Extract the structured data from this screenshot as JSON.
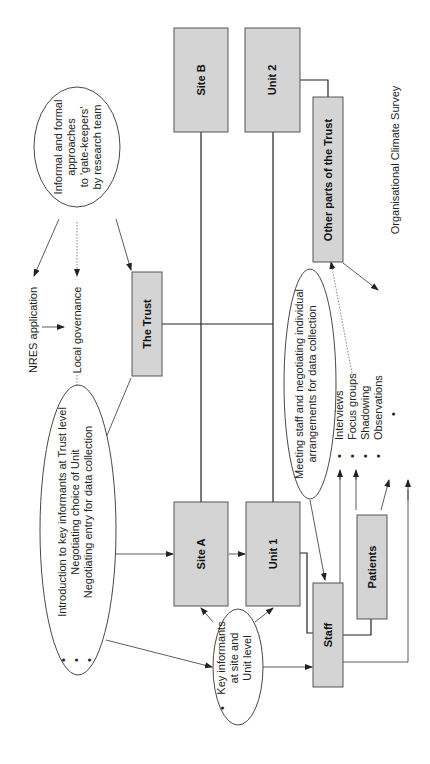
{
  "diagram": {
    "orientation": "rotated-90-ccw",
    "boxes": {
      "the_trust": "The Trust",
      "site_a": "Site A",
      "site_b": "Site B",
      "unit_1": "Unit 1",
      "unit_2": "Unit 2",
      "staff": "Staff",
      "patients": "Patients",
      "other_parts": "Other parts of the Trust"
    },
    "labels": {
      "nres": "NRES application",
      "local_gov": "Local governance",
      "org_survey": "Organisational Climate Survey"
    },
    "ellipses": {
      "gatekeepers": [
        "Informal and formal",
        "approaches",
        "to 'gate-keepers'",
        "by research team"
      ],
      "trust_level": [
        "Introduction to key informants at Trust level",
        "Negotiating choice of Unit",
        "Negotiating entry for data collection"
      ],
      "key_informants": [
        "Key informants",
        "at site and",
        "Unit level"
      ],
      "meeting_staff": [
        "Meeting staff and negotiating individual",
        "arrangements for data collection"
      ]
    },
    "methods": [
      "Interviews",
      "Focus groups",
      "Shadowing",
      "Observations"
    ],
    "bullet": "•",
    "colors": {
      "box_fill": "#d4d4d4",
      "box_stroke": "#555555",
      "line": "#222222"
    }
  }
}
